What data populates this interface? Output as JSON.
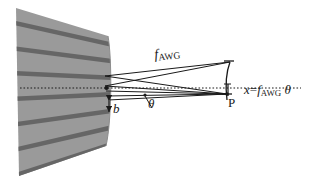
{
  "figure": {
    "kind": "optical-ray-diagram",
    "title_text": "",
    "width_px": 309,
    "height_px": 182,
    "background_color": "#ffffff"
  },
  "colors": {
    "slab_fill": "#9a9a9a",
    "slab_stripe": "#666666",
    "ray_line": "#1a1a1a",
    "axis_dotted": "#1a1a1a",
    "label_text": "#1a1a1a"
  },
  "labels": {
    "focal_length": {
      "symbol": "f",
      "subscript": "AWG",
      "full_text": "f_AWG"
    },
    "angle": {
      "symbol": "θ",
      "full_text": "θ"
    },
    "waveguide_pitch": {
      "symbol": "b",
      "full_text": "b"
    },
    "focal_point": {
      "symbol": "P",
      "full_text": "P"
    },
    "displacement": {
      "lhs": "x",
      "equals": "=",
      "symbol": "f",
      "subscript": "AWG",
      "angle": "θ",
      "full_text": "x=f_AWG θ"
    }
  },
  "elements": {
    "slab_waveguide_array": "arrayed-waveguide-grating-slab",
    "stripe_count": 7,
    "optical_axis": "dotted horizontal center line",
    "focal_arc": "vertical curved focal line at image plane",
    "ray_bundle": "converging rays from waveguide aperture to point P",
    "pitch_arrow": "double-headed vertical arrow marking waveguide pitch b"
  }
}
